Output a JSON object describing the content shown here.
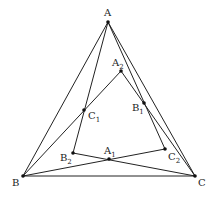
{
  "diagram": {
    "type": "geometry",
    "stroke_color": "#222222",
    "background": "#ffffff",
    "points": {
      "A": {
        "label": "A",
        "sub": "",
        "x": 108,
        "y": 22,
        "lx": 104,
        "ly": 16
      },
      "B": {
        "label": "B",
        "sub": "",
        "x": 23,
        "y": 176,
        "lx": 12,
        "ly": 186
      },
      "C": {
        "label": "C",
        "sub": "",
        "x": 195,
        "y": 176,
        "lx": 198,
        "ly": 186
      },
      "A1": {
        "label": "A",
        "sub": "1",
        "x": 109,
        "y": 159,
        "lx": 104,
        "ly": 154
      },
      "B1": {
        "label": "B",
        "sub": "1",
        "x": 144,
        "y": 103,
        "lx": 132,
        "ly": 111
      },
      "C1": {
        "label": "C",
        "sub": "1",
        "x": 84,
        "y": 110,
        "lx": 88,
        "ly": 119
      },
      "A2": {
        "label": "A",
        "sub": "2",
        "x": 121,
        "y": 71,
        "lx": 112,
        "ly": 66
      },
      "B2": {
        "label": "B",
        "sub": "2",
        "x": 73,
        "y": 153,
        "lx": 60,
        "ly": 161
      },
      "C2": {
        "label": "C",
        "sub": "2",
        "x": 165,
        "y": 149,
        "lx": 168,
        "ly": 160
      }
    },
    "segments": [
      [
        "A",
        "B"
      ],
      [
        "B",
        "C"
      ],
      [
        "C",
        "A"
      ],
      [
        "A",
        "B2"
      ],
      [
        "B",
        "A2"
      ],
      [
        "A",
        "C2"
      ],
      [
        "C",
        "A2"
      ],
      [
        "B",
        "C2"
      ],
      [
        "C",
        "B2"
      ]
    ]
  }
}
